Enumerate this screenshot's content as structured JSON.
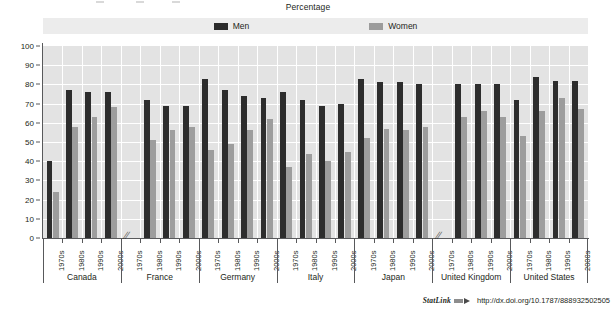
{
  "subtitle": "Percentage",
  "legend": {
    "position": "top-center",
    "entries": [
      {
        "label": "Men",
        "color": "#2d2d2d",
        "icon": "men-swatch"
      },
      {
        "label": "Women",
        "color": "#9d9d9d",
        "icon": "women-swatch"
      }
    ]
  },
  "axes": {
    "y_ticks": [
      "100",
      "90",
      "80",
      "70",
      "60",
      "50",
      "40",
      "30",
      "20",
      "10",
      "0"
    ],
    "ylim": [
      0,
      100
    ],
    "decade_labels": [
      "1970s",
      "1980s",
      "1990s",
      "2000s"
    ],
    "groups": [
      "Canada",
      "France",
      "Germany",
      "Italy",
      "Japan",
      "United Kingdom",
      "United States"
    ],
    "break_marker": "//"
  },
  "footer": {
    "statlink_label": "StatLink",
    "statlink_icon": "statlink-arrow-icon",
    "url": "http://dx.doi.org/10.1787/888932502505"
  },
  "chart_data": {
    "type": "bar",
    "title": "",
    "subtitle": "Percentage",
    "xlabel": "",
    "ylabel": "Percentage",
    "ylim": [
      0,
      100
    ],
    "ytick_step": 10,
    "grid": true,
    "legend_position": "top-center",
    "categories": [
      "Canada 1970s",
      "Canada 1980s",
      "Canada 1990s",
      "Canada 2000s",
      "France 1970s",
      "France 1980s",
      "France 1990s",
      "France 2000s",
      "Germany 1970s",
      "Germany 1980s",
      "Germany 1990s",
      "Germany 2000s",
      "Italy 1970s",
      "Italy 1980s",
      "Italy 1990s",
      "Italy 2000s",
      "Japan 1970s",
      "Japan 1980s",
      "Japan 1990s",
      "Japan 2000s",
      "United Kingdom 1970s",
      "United Kingdom 1980s",
      "United Kingdom 1990s",
      "United Kingdom 2000s",
      "United States 1970s",
      "United States 1980s",
      "United States 1990s",
      "United States 2000s"
    ],
    "series": [
      {
        "name": "Men",
        "color": "#2d2d2d",
        "values": [
          40,
          77,
          76,
          76,
          null,
          72,
          69,
          69,
          83,
          77,
          74,
          73,
          76,
          72,
          69,
          70,
          83,
          81,
          81,
          80,
          null,
          80,
          80,
          80,
          72,
          84,
          82,
          82
        ]
      },
      {
        "name": "Women",
        "color": "#9d9d9d",
        "values": [
          24,
          58,
          63,
          68,
          null,
          51,
          56,
          58,
          46,
          49,
          56,
          62,
          37,
          44,
          40,
          45,
          52,
          57,
          56,
          58,
          null,
          63,
          66,
          63,
          53,
          66,
          73,
          67
        ]
      }
    ],
    "groups": [
      {
        "name": "Canada",
        "decades": [
          "1970s",
          "1980s",
          "1990s",
          "2000s"
        ],
        "men": [
          40,
          77,
          76,
          76
        ],
        "women": [
          24,
          58,
          63,
          68
        ],
        "break_at": null
      },
      {
        "name": "France",
        "decades": [
          "1970s",
          "1980s",
          "1990s",
          "2000s"
        ],
        "men": [
          null,
          72,
          69,
          69
        ],
        "women": [
          null,
          51,
          56,
          58
        ],
        "break_at": "1970s"
      },
      {
        "name": "Germany",
        "decades": [
          "1970s",
          "1980s",
          "1990s",
          "2000s"
        ],
        "men": [
          83,
          77,
          74,
          73
        ],
        "women": [
          46,
          49,
          56,
          62
        ],
        "break_at": null
      },
      {
        "name": "Italy",
        "decades": [
          "1970s",
          "1980s",
          "1990s",
          "2000s"
        ],
        "men": [
          76,
          72,
          69,
          70
        ],
        "women": [
          37,
          44,
          40,
          45
        ],
        "break_at": null
      },
      {
        "name": "Japan",
        "decades": [
          "1970s",
          "1980s",
          "1990s",
          "2000s"
        ],
        "men": [
          83,
          81,
          81,
          80
        ],
        "women": [
          52,
          57,
          56,
          58
        ],
        "break_at": null
      },
      {
        "name": "United Kingdom",
        "decades": [
          "1970s",
          "1980s",
          "1990s",
          "2000s"
        ],
        "men": [
          null,
          80,
          80,
          80
        ],
        "women": [
          null,
          63,
          66,
          63
        ],
        "break_at": "1970s"
      },
      {
        "name": "United States",
        "decades": [
          "1970s",
          "1980s",
          "1990s",
          "2000s"
        ],
        "men": [
          72,
          84,
          82,
          82
        ],
        "women": [
          53,
          66,
          73,
          67
        ],
        "break_at": null
      }
    ]
  }
}
